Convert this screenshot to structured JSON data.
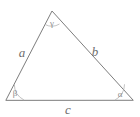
{
  "figure": {
    "type": "geometry-diagram",
    "shape": "triangle",
    "background_color": "#ffffff",
    "stroke_color": "#7d7d7d",
    "label_color": "#6e6e6e",
    "angle_label_color": "#8d8d8d"
  },
  "vertices": [
    {
      "id": "apex",
      "x": 52,
      "y": 11,
      "angle_label": "γ"
    },
    {
      "id": "bottom-left",
      "x": 6,
      "y": 100,
      "angle_label": "β"
    },
    {
      "id": "bottom-right",
      "x": 133,
      "y": 100,
      "angle_label": "α"
    }
  ],
  "sides": [
    {
      "id": "left",
      "label": "a",
      "label_x": 22,
      "label_y": 57,
      "from": "bottom-left",
      "to": "apex"
    },
    {
      "id": "right",
      "label": "b",
      "label_x": 95,
      "label_y": 56,
      "from": "apex",
      "to": "bottom-right"
    },
    {
      "id": "bottom",
      "label": "c",
      "label_x": 68,
      "label_y": 114,
      "from": "bottom-left",
      "to": "bottom-right"
    }
  ],
  "angles": [
    {
      "id": "gamma",
      "symbol": "γ",
      "label_x": 52,
      "label_y": 26,
      "at": "apex"
    },
    {
      "id": "beta",
      "symbol": "β",
      "label_x": 15,
      "label_y": 96,
      "at": "bottom-left"
    },
    {
      "id": "alpha",
      "symbol": "α",
      "label_x": 120,
      "label_y": 97,
      "at": "bottom-right"
    }
  ],
  "geometry": {
    "path": "M 6 100 L 52 11 L 133 100 Z"
  }
}
